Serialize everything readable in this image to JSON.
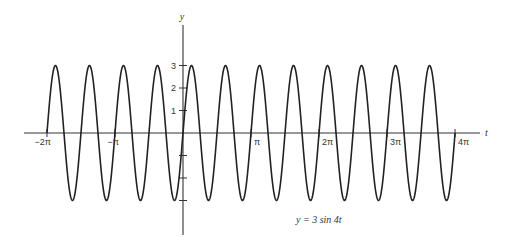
{
  "chart_data": {
    "type": "line",
    "title": "",
    "equation_label": "y = 3 sin 4t",
    "xlabel": "t",
    "ylabel": "y",
    "x_ticks": [
      {
        "value": -6.283185,
        "label": "−2π"
      },
      {
        "value": -3.141593,
        "label": "−π"
      },
      {
        "value": 3.141593,
        "label": "π"
      },
      {
        "value": 6.283185,
        "label": "2π"
      },
      {
        "value": 9.424778,
        "label": "3π"
      },
      {
        "value": 12.566371,
        "label": "4π"
      }
    ],
    "y_ticks": [
      {
        "value": 3,
        "label": "3"
      },
      {
        "value": 2,
        "label": "2"
      },
      {
        "value": 1,
        "label": "1"
      },
      {
        "value": -1,
        "label": ""
      },
      {
        "value": -2,
        "label": ""
      },
      {
        "value": -3,
        "label": ""
      }
    ],
    "xlim": [
      -7.0,
      13.5
    ],
    "ylim": [
      -4.6,
      4.8
    ],
    "grid": false,
    "legend": null,
    "series": [
      {
        "name": "y = 3 sin 4t",
        "function": "3*sin(4*t)",
        "amplitude": 3,
        "angular_frequency": 4,
        "period": 1.570796,
        "t_range": [
          -6.283185,
          12.566371
        ],
        "color": "#222222"
      }
    ]
  },
  "layout": {
    "origin_px": [
      183,
      133
    ],
    "px_per_unit_x": 21.65,
    "px_per_unit_y": 22.5,
    "x_axis_px": [
      24,
      480
    ],
    "y_axis_px": [
      25,
      235
    ]
  }
}
